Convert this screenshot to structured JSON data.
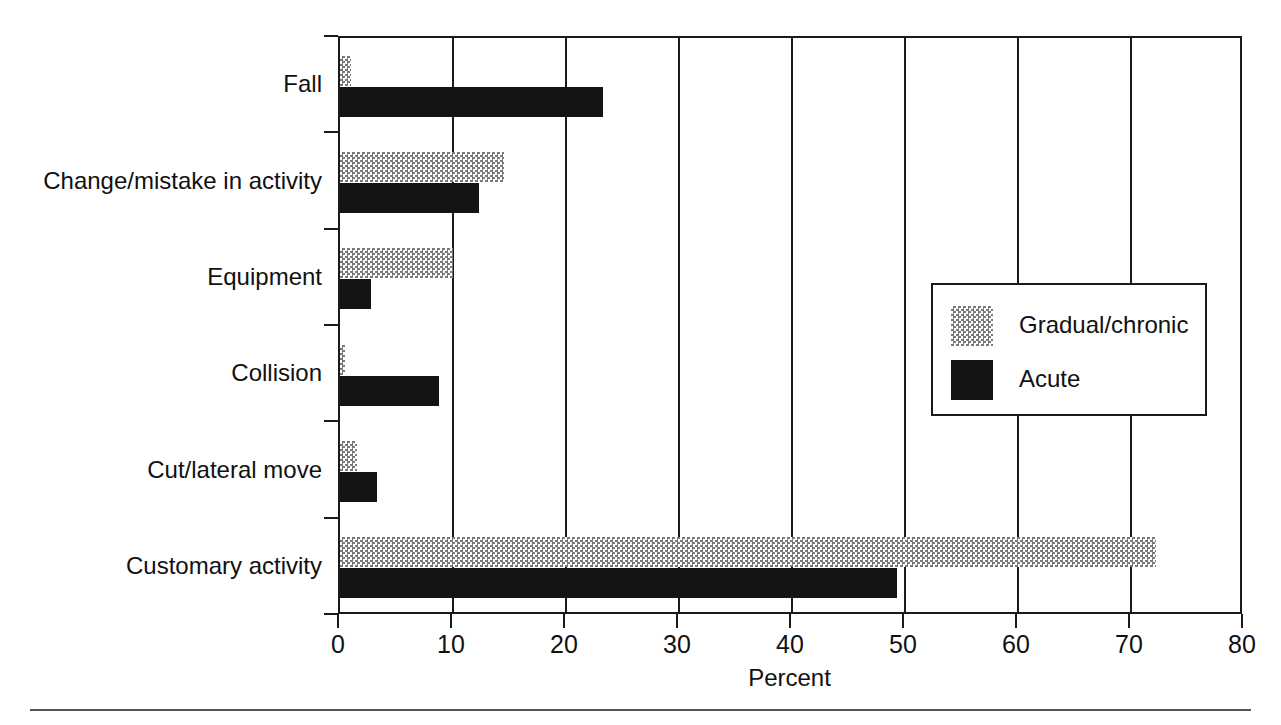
{
  "chart_data": {
    "type": "bar",
    "orientation": "horizontal",
    "title": "",
    "xlabel": "Percent",
    "ylabel": "",
    "xlim": [
      0,
      80
    ],
    "xticks": [
      0,
      10,
      20,
      30,
      40,
      50,
      60,
      70,
      80
    ],
    "xticklabels": [
      "0",
      "10",
      "20",
      "30",
      "40",
      "50",
      "60",
      "70",
      "80"
    ],
    "grid": "vertical",
    "legend_position": "center-right",
    "categories": [
      "Fall",
      "Change/mistake in activity",
      "Equipment",
      "Collision",
      "Cut/lateral move",
      "Customary activity"
    ],
    "series": [
      {
        "name": "Gradual/chronic",
        "pattern": "dotted",
        "color": "#7a7a7a",
        "values": [
          1.0,
          14.5,
          10.0,
          0.4,
          1.5,
          72.2
        ]
      },
      {
        "name": "Acute",
        "pattern": "solid",
        "color": "#141414",
        "values": [
          23.3,
          12.3,
          2.7,
          8.8,
          3.3,
          49.3
        ]
      }
    ]
  },
  "legend": {
    "entries": [
      {
        "label": "Gradual/chronic"
      },
      {
        "label": "Acute"
      }
    ]
  },
  "axis": {
    "x_title": "Percent"
  }
}
